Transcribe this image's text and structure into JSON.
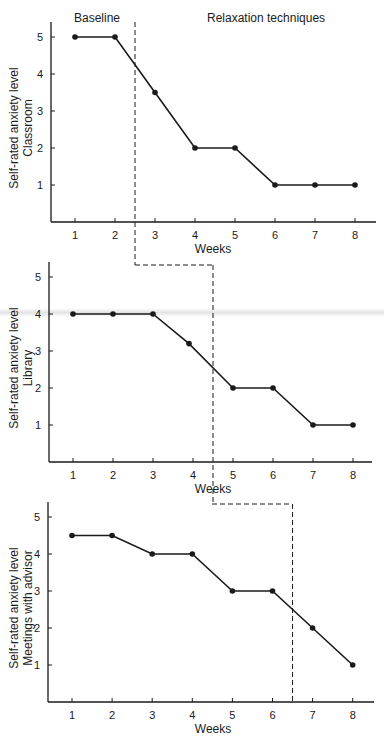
{
  "chart_data": {
    "type": "line",
    "title": "",
    "phase_labels": {
      "baseline": "Baseline",
      "treatment": "Relaxation techniques"
    },
    "line_color": "#1a1a1a",
    "panels": [
      {
        "name": "Classroom",
        "ylabel_line1": "Self-rated anxiety level",
        "ylabel_line2": "Classroom",
        "xlabel": "Weeks",
        "x": [
          1,
          2,
          3,
          4,
          5,
          6,
          7,
          8
        ],
        "values": [
          5,
          5,
          3.5,
          2,
          2,
          1,
          1,
          1
        ],
        "yticks": [
          1,
          2,
          3,
          4,
          5
        ],
        "xticks": [
          1,
          2,
          3,
          4,
          5,
          6,
          7,
          8
        ],
        "ylim": [
          0,
          5
        ],
        "phase_change_after_week": 2.5,
        "box": {
          "axisX": 51,
          "x1px": 75,
          "dxpx": 40,
          "axisY": 222,
          "y1px": 185,
          "dypx": 39,
          "xEnd": 376,
          "yTop": 22
        }
      },
      {
        "name": "Library",
        "ylabel_line1": "Self-rated anxiety level",
        "ylabel_line2": "Library",
        "xlabel": "Weeks",
        "x": [
          1,
          2,
          3,
          4,
          5,
          6,
          7,
          8
        ],
        "values": [
          4,
          4,
          4,
          3.2,
          2,
          2,
          1,
          1
        ],
        "x_positions_override": {
          "3": 3.9
        },
        "yticks": [
          1,
          2,
          3,
          4,
          5
        ],
        "xticks": [
          1,
          2,
          3,
          4,
          5,
          6,
          7,
          8
        ],
        "ylim": [
          0,
          5
        ],
        "phase_change_after_week": 4.5,
        "box": {
          "axisX": 49,
          "x1px": 73,
          "dxpx": 40,
          "axisY": 462,
          "y1px": 425,
          "dypx": 39,
          "xEnd": 372,
          "yTop": 262
        }
      },
      {
        "name": "Meetings with advisor",
        "ylabel_line1": "Self-rated anxiety level",
        "ylabel_line2": "Meetings with advisor",
        "xlabel": "Weeks",
        "x": [
          1,
          2,
          3,
          4,
          5,
          6,
          7,
          8
        ],
        "values": [
          4.5,
          4.5,
          4,
          4,
          3,
          3,
          2,
          1
        ],
        "yticks": [
          1,
          2,
          3,
          4,
          5
        ],
        "xticks": [
          1,
          2,
          3,
          4,
          5,
          6,
          7,
          8
        ],
        "ylim": [
          0,
          5
        ],
        "phase_change_after_week": 6.5,
        "box": {
          "axisX": 48,
          "x1px": 72,
          "dxpx": 40.1,
          "axisY": 702,
          "y1px": 665,
          "dypx": 39,
          "xEnd": 374,
          "yTop": 502
        }
      }
    ],
    "connectors": [
      {
        "from_x": 135,
        "to_x": 213,
        "y": 265,
        "from_panel": 0,
        "to_panel": 1
      },
      {
        "from_x": 212,
        "to_x": 292,
        "y": 504,
        "from_panel": 1,
        "to_panel": 2
      }
    ],
    "grid": false,
    "legend": null
  }
}
